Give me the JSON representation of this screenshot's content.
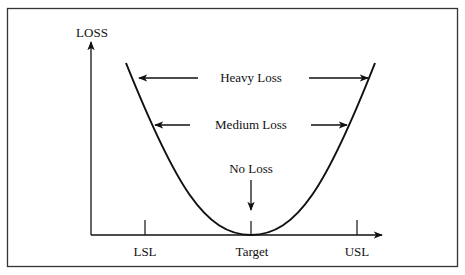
{
  "diagram": {
    "y_axis_label": "LOSS",
    "x_ticks": [
      {
        "label": "LSL",
        "x": 145
      },
      {
        "label": "Target",
        "x": 251
      },
      {
        "label": "USL",
        "x": 357
      }
    ],
    "annotations": {
      "heavy": "Heavy Loss",
      "medium": "Medium Loss",
      "none": "No Loss"
    },
    "colors": {
      "stroke": "#111111",
      "background": "#ffffff",
      "frame": "#333333"
    }
  }
}
